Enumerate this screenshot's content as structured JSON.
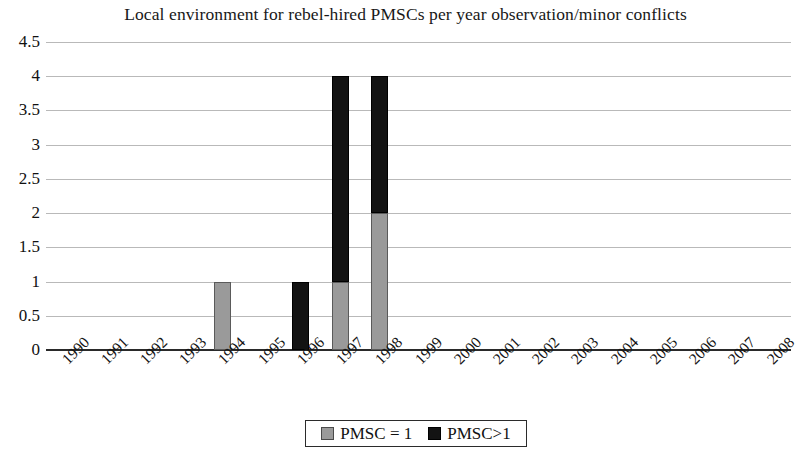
{
  "chart_data": {
    "type": "bar",
    "title": "Local environment for rebel-hired PMSCs per year observation/minor conflicts",
    "xlabel": "",
    "ylabel": "",
    "ylim": [
      0,
      4.5
    ],
    "ytick_labels": [
      "4.5",
      "4",
      "3.5",
      "3",
      "2.5",
      "2",
      "1.5",
      "1",
      "0.5",
      "0"
    ],
    "ytick_values": [
      4.5,
      4,
      3.5,
      3,
      2.5,
      2,
      1.5,
      1,
      0.5,
      0
    ],
    "grid": true,
    "stacked": true,
    "legend_position": "bottom",
    "categories": [
      "1990",
      "1991",
      "1992",
      "1993",
      "1994",
      "1995",
      "1996",
      "1997",
      "1998",
      "1999",
      "2000",
      "2001",
      "2002",
      "2003",
      "2004",
      "2005",
      "2006",
      "2007",
      "2008"
    ],
    "series": [
      {
        "name": "PMSC = 1",
        "color": "#9a9a9a",
        "values": [
          0,
          0,
          0,
          0,
          1,
          0,
          0,
          1,
          2,
          0,
          0,
          0,
          0,
          0,
          0,
          0,
          0,
          0,
          0
        ]
      },
      {
        "name": "PMSC>1",
        "color": "#131313",
        "values": [
          0,
          0,
          0,
          0,
          0,
          0,
          1,
          3,
          2,
          0,
          0,
          0,
          0,
          0,
          0,
          0,
          0,
          0,
          0
        ]
      }
    ],
    "totals": [
      0,
      0,
      0,
      0,
      1,
      0,
      1,
      4,
      4,
      0,
      0,
      0,
      0,
      0,
      0,
      0,
      0,
      0,
      0
    ]
  },
  "legend": {
    "items": [
      {
        "label": "PMSC = 1",
        "swatch": "gray-swatch"
      },
      {
        "label": "PMSC>1",
        "swatch": "black-swatch"
      }
    ]
  }
}
